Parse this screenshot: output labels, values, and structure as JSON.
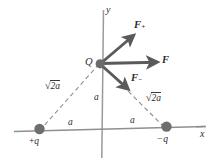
{
  "figure": {
    "background_color": "#ffffff",
    "ink_color": "#4a4a4a",
    "arrow_color": "#5a5a5a",
    "text_color": "#2b2b2b",
    "charge_dot_color": "#6e6e6e"
  },
  "axes": {
    "x_label": "x",
    "y_label": "y"
  },
  "points": {
    "center_charge_label": "Q",
    "left_charge_label": "+q",
    "left_charge_sign": "+",
    "left_charge_symbol": "q",
    "right_charge_label": "−q",
    "right_charge_sign": "−",
    "right_charge_symbol": "q"
  },
  "vectors": [
    {
      "name": "force-plus",
      "symbol": "F",
      "subscript": "+",
      "direction": "up-right",
      "label": "F+"
    },
    {
      "name": "force-resultant",
      "symbol": "F",
      "subscript": "",
      "direction": "right",
      "label": "F"
    },
    {
      "name": "force-minus",
      "symbol": "F",
      "subscript": "−",
      "direction": "down-right",
      "label": "F-"
    }
  ],
  "distances": {
    "vertical": "a",
    "left_horizontal": "a",
    "right_horizontal": "a",
    "left_diagonal_sign": "√",
    "left_diagonal_radicand": "2a",
    "right_diagonal_sign": "√",
    "right_diagonal_radicand": "2a"
  }
}
